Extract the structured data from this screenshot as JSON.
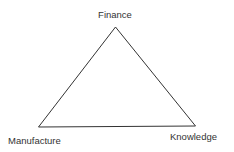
{
  "diagram": {
    "type": "triangle",
    "stroke_color": "#333333",
    "vertices": [
      {
        "id": "top",
        "label": "Finance"
      },
      {
        "id": "bottom-left",
        "label": "Manufacture"
      },
      {
        "id": "bottom-right",
        "label": "Knowledge"
      }
    ],
    "edges": [
      {
        "from": "Finance",
        "to": "Manufacture"
      },
      {
        "from": "Finance",
        "to": "Knowledge"
      },
      {
        "from": "Manufacture",
        "to": "Knowledge"
      }
    ]
  }
}
